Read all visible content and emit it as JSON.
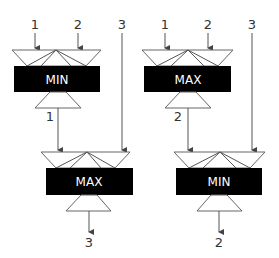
{
  "colors": {
    "box": "#000000",
    "box_text": "#ffffff",
    "line": "#555555",
    "label": "#333333"
  },
  "networks": [
    {
      "stage1": {
        "op": "MIN",
        "inputs": [
          "1",
          "2"
        ],
        "output": "1"
      },
      "passthrough_input": "3",
      "stage2": {
        "op": "MAX",
        "output": "3"
      }
    },
    {
      "stage1": {
        "op": "MAX",
        "inputs": [
          "1",
          "2"
        ],
        "output": "2"
      },
      "passthrough_input": "3",
      "stage2": {
        "op": "MIN",
        "output": "2"
      }
    }
  ]
}
